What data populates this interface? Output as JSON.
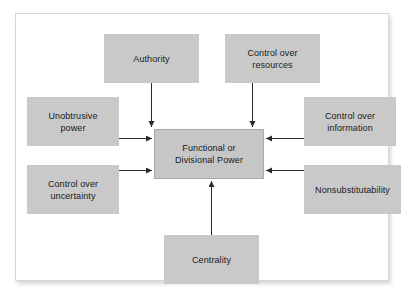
{
  "diagram": {
    "type": "influence-diagram",
    "center": {
      "id": "functional-or-divisional-power",
      "label": "Functional or\nDivisional Power"
    },
    "sources": [
      {
        "id": "authority",
        "label": "Authority",
        "position": "top-left",
        "arrow": "down"
      },
      {
        "id": "control-over-resources",
        "label": "Control over\nresources",
        "position": "top-right",
        "arrow": "down"
      },
      {
        "id": "unobtrusive-power",
        "label": "Unobtrusive\npower",
        "position": "left-upper",
        "arrow": "right"
      },
      {
        "id": "control-over-uncertainty",
        "label": "Control over\nuncertainty",
        "position": "left-lower",
        "arrow": "right"
      },
      {
        "id": "control-over-information",
        "label": "Control over\ninformation",
        "position": "right-upper",
        "arrow": "left"
      },
      {
        "id": "nonsubstitutability",
        "label": "Nonsubstitutability",
        "position": "right-lower",
        "arrow": "left"
      },
      {
        "id": "centrality",
        "label": "Centrality",
        "position": "bottom",
        "arrow": "up"
      }
    ],
    "colors": {
      "node_fill": "#c9c9c9",
      "center_fill": "#c6c6c6",
      "arrow": "#2b2b2b",
      "frame_border": "#d7d7d7",
      "page_background": "#ffffff"
    }
  }
}
